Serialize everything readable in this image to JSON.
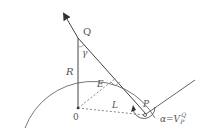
{
  "diagram": {
    "labels": {
      "Q": "Q",
      "R": "R",
      "gamma": "γ",
      "E": "E",
      "O": "0",
      "L": "L",
      "P": "P",
      "alpha_eq": "α=V",
      "alpha_sub": "P",
      "alpha_sup": "Q"
    },
    "colors": {
      "stroke": "#555555",
      "dashed": "#888888",
      "arc": "#777777"
    }
  }
}
